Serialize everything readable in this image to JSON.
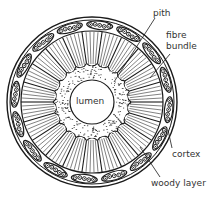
{
  "diagram": {
    "type": "stem cross-section",
    "colors": {
      "ink": "#1a1a1a",
      "background": "#ffffff",
      "label": "#333333"
    },
    "geometry": {
      "cx": 92,
      "cy": 102,
      "outer_r": 85,
      "outer_inner_r": 82,
      "bundle_ring_r": 77,
      "bundle_count": 16,
      "woody_outer_r": 71,
      "woody_inner_r": 37,
      "wedge_count": 22,
      "pith_r": 40,
      "lumen_r": 22
    },
    "labels": {
      "lumen": "lumen",
      "pith": "pith",
      "fibre_bundle_line1": "fibre",
      "fibre_bundle_line2": "bundle",
      "cortex": "cortex",
      "woody_layer": "woody layer"
    }
  }
}
